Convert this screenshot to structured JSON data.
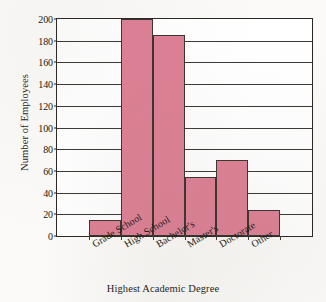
{
  "chart_data": {
    "type": "bar",
    "title": "",
    "xlabel": "Highest Academic Degree",
    "ylabel": "Number of Employees",
    "categories": [
      "Grade School",
      "High School",
      "Bachelor's",
      "Master's",
      "Doctorate",
      "Other"
    ],
    "values": [
      15,
      200,
      185,
      54,
      70,
      24
    ],
    "ylim": [
      0,
      200
    ],
    "ytick_labels": [
      "0",
      "20",
      "40",
      "60",
      "80",
      "100",
      "120",
      "140",
      "160",
      "180",
      "200"
    ],
    "ytick_values": [
      0,
      20,
      40,
      60,
      80,
      100,
      120,
      140,
      160,
      180,
      200
    ],
    "grid": true,
    "legend": "none",
    "bar_color": "#dd8095",
    "bar_edge_color": "#3a3330",
    "plot_background": "#ffffff",
    "page_background": "#fbfaf8",
    "axis_color": "#2b2724",
    "bars_adjacent": true,
    "leading_empty_slot": true,
    "trailing_empty_slot": true
  }
}
